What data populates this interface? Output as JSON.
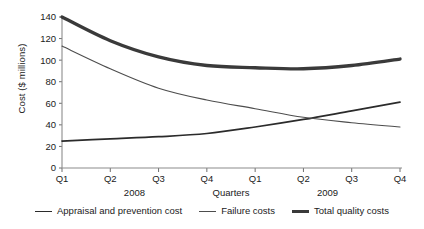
{
  "chart_data": {
    "type": "line",
    "title": "",
    "subtitle": "",
    "xlabel": "Quarters",
    "ylabel": "Cost ($ millions)",
    "categories": [
      "Q1",
      "Q2",
      "Q3",
      "Q4",
      "Q1",
      "Q2",
      "Q3",
      "Q4"
    ],
    "x_group_labels": [
      "2008",
      "Quarters",
      "2009"
    ],
    "ylim": [
      0,
      140
    ],
    "yticks": [
      0,
      20,
      40,
      60,
      80,
      100,
      120,
      140
    ],
    "ytick_labels": [
      "0",
      "20",
      "40",
      "60",
      "80",
      "100",
      "120",
      "140"
    ],
    "grid": false,
    "legend_position": "bottom",
    "series": [
      {
        "name": "Appraisal and prevention cost",
        "color": "#2b2b2b",
        "width": 1.7,
        "values": [
          25,
          27,
          29,
          32,
          38,
          45,
          53,
          61
        ]
      },
      {
        "name": "Failure costs",
        "color": "#4d4d4d",
        "width": 1.1,
        "values": [
          113,
          92,
          74,
          63,
          55,
          47,
          42,
          38
        ]
      },
      {
        "name": "Total quality costs",
        "color": "#3a3a3a",
        "width": 3.4,
        "values": [
          140,
          118,
          103,
          95,
          93,
          92,
          95,
          101
        ]
      }
    ]
  },
  "axis": {
    "axis_color": "#8c8c8c",
    "text_color": "#1a1a1a"
  }
}
